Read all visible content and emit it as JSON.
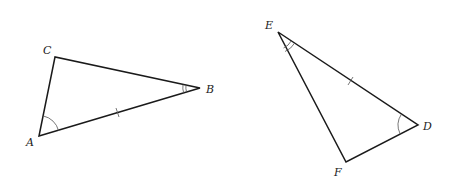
{
  "diagram": {
    "type": "congruent-triangles",
    "colors": {
      "stroke": "#1a1a1a",
      "marks": "#555555",
      "label": "#222222"
    },
    "triangles": [
      {
        "name": "ABC",
        "vertices": [
          {
            "id": "A",
            "label": "A",
            "x": 39,
            "y": 136,
            "label_x": 26,
            "label_y": 146
          },
          {
            "id": "B",
            "label": "B",
            "x": 200,
            "y": 88,
            "label_x": 206,
            "label_y": 93
          },
          {
            "id": "C",
            "label": "C",
            "x": 55,
            "y": 57,
            "label_x": 43,
            "label_y": 54
          }
        ],
        "side_ticks": [
          {
            "side": "AB",
            "count": 1
          }
        ],
        "angle_marks": [
          {
            "vertex": "A",
            "arcs": 1
          },
          {
            "vertex": "B",
            "arcs": 2
          }
        ]
      },
      {
        "name": "DEF",
        "vertices": [
          {
            "id": "D",
            "label": "D",
            "x": 418,
            "y": 125,
            "label_x": 423,
            "label_y": 130
          },
          {
            "id": "E",
            "label": "E",
            "x": 278,
            "y": 32,
            "label_x": 265,
            "label_y": 29
          },
          {
            "id": "F",
            "label": "F",
            "x": 346,
            "y": 162,
            "label_x": 334,
            "label_y": 176
          }
        ],
        "side_ticks": [
          {
            "side": "ED",
            "count": 1
          }
        ],
        "angle_marks": [
          {
            "vertex": "E",
            "arcs": 2
          },
          {
            "vertex": "D",
            "arcs": 1
          }
        ]
      }
    ]
  }
}
